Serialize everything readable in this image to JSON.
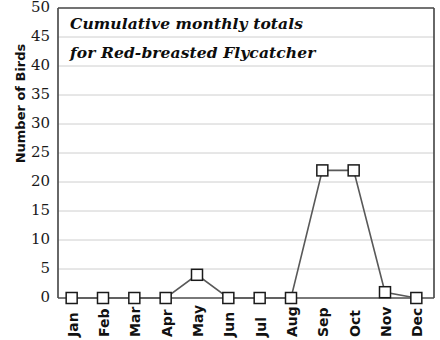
{
  "chart_data": {
    "type": "line",
    "title": "Cumulative monthly totals for Red-breasted Flycatcher",
    "title_lines": [
      "Cumulative monthly totals",
      "for Red-breasted Flycatcher"
    ],
    "xlabel": "",
    "ylabel": "Number of Birds",
    "categories": [
      "Jan",
      "Feb",
      "Mar",
      "Apr",
      "May",
      "Jun",
      "Jul",
      "Aug",
      "Sep",
      "Oct",
      "Nov",
      "Dec"
    ],
    "values": [
      0,
      0,
      0,
      0,
      4,
      0,
      0,
      0,
      22,
      22,
      1,
      0
    ],
    "ylim": [
      0,
      50
    ],
    "ytick_values": [
      0,
      5,
      10,
      15,
      20,
      25,
      30,
      35,
      40,
      45,
      50
    ],
    "ytick_labels": [
      "0",
      "5",
      "10",
      "15",
      "20",
      "25",
      "30",
      "35",
      "40",
      "45",
      "50"
    ],
    "grid": true,
    "grid_axis": "y",
    "legend": false,
    "marker": "open-square",
    "colors": {
      "line": "#595959",
      "marker_face": "#ffffff",
      "marker_edge": "#1a1a1a",
      "grid": "#c8c8c8",
      "axis": "#4d4d4d",
      "text": "#111111",
      "background": "#ffffff"
    }
  }
}
